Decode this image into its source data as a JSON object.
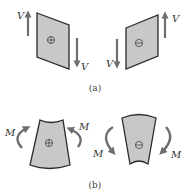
{
  "figure": {
    "panel_a": {
      "caption": "(a)",
      "left_element": {
        "sign": "plus",
        "force_label_top": "V",
        "force_label_bottom": "V"
      },
      "right_element": {
        "sign": "minus",
        "force_label_top": "V",
        "force_label_bottom": "V"
      }
    },
    "panel_b": {
      "caption": "(b)",
      "left_element": {
        "sign": "plus",
        "moment_label_left": "M",
        "moment_label_right": "M"
      },
      "right_element": {
        "sign": "minus",
        "moment_label_left": "M",
        "moment_label_right": "M"
      }
    },
    "colors": {
      "fill": "#c8c8c8",
      "edge": "#2a2a2a",
      "arrow": "#6e6e6e",
      "background": "#ffffff"
    }
  }
}
